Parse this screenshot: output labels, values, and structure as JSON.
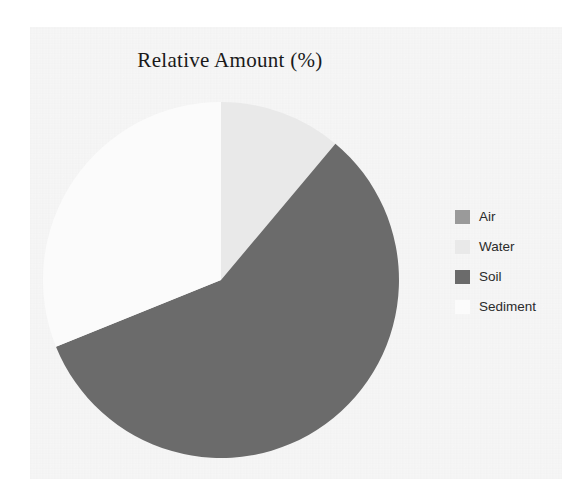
{
  "chart_data": {
    "type": "pie",
    "title": "Relative Amount (%)",
    "xlabel": "",
    "ylabel": "",
    "legend_position": "right",
    "grid": false,
    "start_angle_deg": 0,
    "direction": "clockwise",
    "categories": [
      "Air",
      "Water",
      "Soil",
      "Sediment"
    ],
    "values": [
      0,
      11,
      58,
      31
    ],
    "slices": [
      {
        "label": "Air",
        "value": 0,
        "color": "#9a9a9a",
        "start_deg": 0,
        "end_deg": 0
      },
      {
        "label": "Water",
        "value": 11,
        "color": "#e9e9e9",
        "start_deg": 0,
        "end_deg": 40
      },
      {
        "label": "Soil",
        "value": 58,
        "color": "#6b6b6b",
        "start_deg": 40,
        "end_deg": 248
      },
      {
        "label": "Sediment",
        "value": 31,
        "color": "#fbfbfb",
        "start_deg": 248,
        "end_deg": 360
      }
    ]
  },
  "chart": {
    "title": "Relative Amount (%)"
  },
  "legend": {
    "items": [
      {
        "label": "Air",
        "color": "#9a9a9a"
      },
      {
        "label": "Water",
        "color": "#e9e9e9"
      },
      {
        "label": "Soil",
        "color": "#6b6b6b"
      },
      {
        "label": "Sediment",
        "color": "#fbfbfb"
      }
    ]
  },
  "colors": {
    "background": "#ffffff",
    "plot_area": "#f6f6f6",
    "air": "#9a9a9a",
    "water": "#e9e9e9",
    "soil": "#6b6b6b",
    "sediment": "#fbfbfb",
    "title_text": "#1a1a1a",
    "legend_text": "#2b2b2b"
  }
}
